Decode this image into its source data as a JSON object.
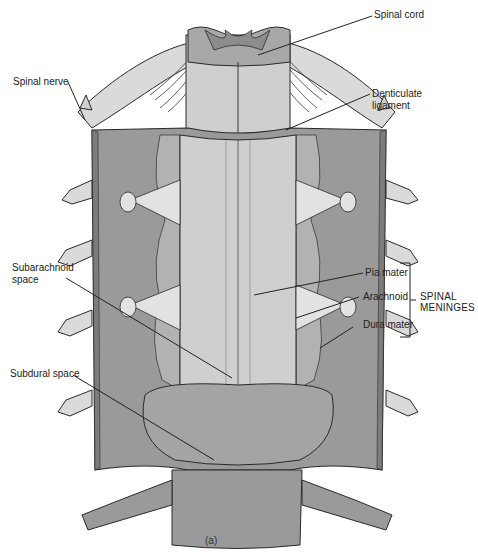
{
  "figure": {
    "caption": "(a)",
    "colors": {
      "dura": "#9a9a9a",
      "dura_dark": "#7c7c7c",
      "cord": "#cfcfcf",
      "nerve": "#d8d8d8",
      "outline": "#2a2a2a",
      "label_text": "#222222",
      "background": "#ffffff"
    },
    "labels": {
      "spinal_cord": "Spinal cord",
      "spinal_nerve": "Spinal nerve",
      "denticulate_ligament_line1": "Denticulate",
      "denticulate_ligament_line2": "ligament",
      "pia_mater": "Pia mater",
      "arachnoid": "Arachnoid",
      "dura_mater": "Dura mater",
      "spinal_meninges_line1": "SPINAL",
      "spinal_meninges_line2": "MENINGES",
      "subarachnoid_space_line1": "Subarachnoid",
      "subarachnoid_space_line2": "space",
      "subdural_space": "Subdural space"
    }
  }
}
